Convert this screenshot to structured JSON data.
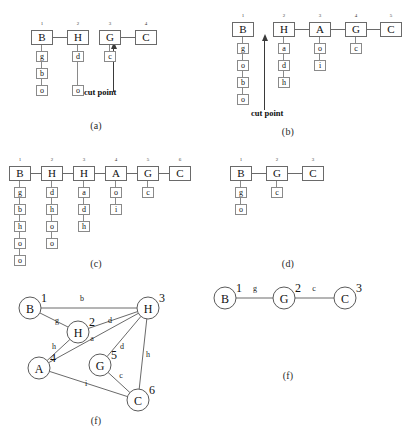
{
  "figure": {
    "panels": [
      {
        "id": "a",
        "caption": "(a)",
        "type": "chain",
        "columns": [
          {
            "index": "1",
            "head": "B",
            "items": [
              "g",
              "b",
              "o"
            ]
          },
          {
            "index": "2",
            "head": "H",
            "items": [
              "d",
              "o"
            ]
          },
          {
            "index": "3",
            "head": "G",
            "items": [
              "c"
            ]
          },
          {
            "index": "4",
            "head": "C",
            "items": []
          }
        ],
        "links": [
          "1-2",
          "3-4"
        ],
        "cut_point": {
          "label": "cut point"
        }
      },
      {
        "id": "b",
        "caption": "(b)",
        "type": "chain",
        "columns": [
          {
            "index": "1",
            "head": "B",
            "items": [
              "g",
              "o",
              "b",
              "o"
            ]
          },
          {
            "index": "2",
            "head": "H",
            "items": [
              "a",
              "d",
              "h"
            ]
          },
          {
            "index": "3",
            "head": "A",
            "items": [
              "o",
              "i"
            ]
          },
          {
            "index": "4",
            "head": "G",
            "items": [
              "c"
            ]
          },
          {
            "index": "5",
            "head": "C",
            "items": []
          }
        ],
        "links": [
          "2-3",
          "3-4",
          "4-5"
        ],
        "cut_point": {
          "label": "cut point"
        }
      },
      {
        "id": "c",
        "caption": "(c)",
        "type": "chain",
        "columns": [
          {
            "index": "1",
            "head": "B",
            "items": [
              "g",
              "b",
              "h",
              "o",
              "o"
            ]
          },
          {
            "index": "2",
            "head": "H",
            "items": [
              "d",
              "h",
              "o",
              "o"
            ]
          },
          {
            "index": "3",
            "head": "H",
            "items": [
              "a",
              "d",
              "h"
            ]
          },
          {
            "index": "4",
            "head": "A",
            "items": [
              "o",
              "i"
            ]
          },
          {
            "index": "5",
            "head": "G",
            "items": [
              "c"
            ]
          },
          {
            "index": "6",
            "head": "C",
            "items": []
          }
        ],
        "links": [
          "1-2",
          "2-3",
          "3-4",
          "4-5",
          "5-6"
        ],
        "cut_point": null
      },
      {
        "id": "d",
        "caption": "(d)",
        "type": "chain",
        "columns": [
          {
            "index": "1",
            "head": "B",
            "items": [
              "g",
              "o"
            ]
          },
          {
            "index": "2",
            "head": "G",
            "items": [
              "c"
            ]
          },
          {
            "index": "3",
            "head": "C",
            "items": []
          }
        ],
        "links": [
          "1-2",
          "2-3"
        ],
        "cut_point": null
      },
      {
        "id": "e",
        "caption": "(f)",
        "type": "graph",
        "nodes": [
          {
            "index": "1",
            "label": "B",
            "x": 30,
            "y": 33
          },
          {
            "index": "2",
            "label": "H",
            "x": 78,
            "y": 57
          },
          {
            "index": "3",
            "label": "H",
            "x": 148,
            "y": 33
          },
          {
            "index": "4",
            "label": "A",
            "x": 39,
            "y": 93
          },
          {
            "index": "5",
            "label": "G",
            "x": 100,
            "y": 90
          },
          {
            "index": "6",
            "label": "C",
            "x": 138,
            "y": 125
          }
        ],
        "edges": [
          {
            "from": "1",
            "to": "3",
            "label": "b",
            "lx": 82,
            "ly": 26
          },
          {
            "from": "1",
            "to": "2",
            "label": "g",
            "lx": 57,
            "ly": 48
          },
          {
            "from": "2",
            "to": "3",
            "label": "d",
            "lx": 110,
            "ly": 48
          },
          {
            "from": "4",
            "to": "2",
            "label": "h",
            "lx": 54,
            "ly": 74
          },
          {
            "from": "4",
            "to": "3",
            "label": "a",
            "lx": 92,
            "ly": 66
          },
          {
            "from": "5",
            "to": "3",
            "label": "d",
            "lx": 122,
            "ly": 74
          },
          {
            "from": "3",
            "to": "6",
            "label": "h",
            "lx": 148,
            "ly": 82
          },
          {
            "from": "5",
            "to": "6",
            "label": "c",
            "lx": 121,
            "ly": 103
          },
          {
            "from": "4",
            "to": "6",
            "label": "i",
            "lx": 86,
            "ly": 111
          }
        ]
      },
      {
        "id": "f",
        "caption": "(f)",
        "type": "graph",
        "nodes": [
          {
            "index": "1",
            "label": "B",
            "x": 33,
            "y": 23
          },
          {
            "index": "2",
            "label": "G",
            "x": 92,
            "y": 23
          },
          {
            "index": "3",
            "label": "C",
            "x": 153,
            "y": 23
          }
        ],
        "edges": [
          {
            "from": "1",
            "to": "2",
            "label": "g",
            "lx": 63,
            "ly": 16
          },
          {
            "from": "2",
            "to": "3",
            "label": "c",
            "lx": 122,
            "ly": 16
          }
        ]
      }
    ]
  },
  "colors": {
    "background": "#ffffff",
    "stroke": "#6a6a6a",
    "text": "#111111",
    "arrow": "#3a3a3a"
  }
}
